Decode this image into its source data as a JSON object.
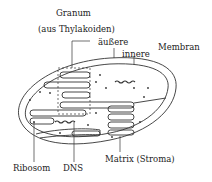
{
  "diagram": {
    "labels": {
      "granum": "Granum",
      "granum_sub": "(aus Thylakoiden)",
      "outer": "äußere",
      "inner": "innere",
      "membrane": "Membran",
      "ribosome": "Ribosom",
      "dna": "DNS",
      "matrix": "Matrix (Stroma)"
    },
    "colors": {
      "stroke": "#333333",
      "text": "#222222",
      "background": "#ffffff"
    }
  }
}
